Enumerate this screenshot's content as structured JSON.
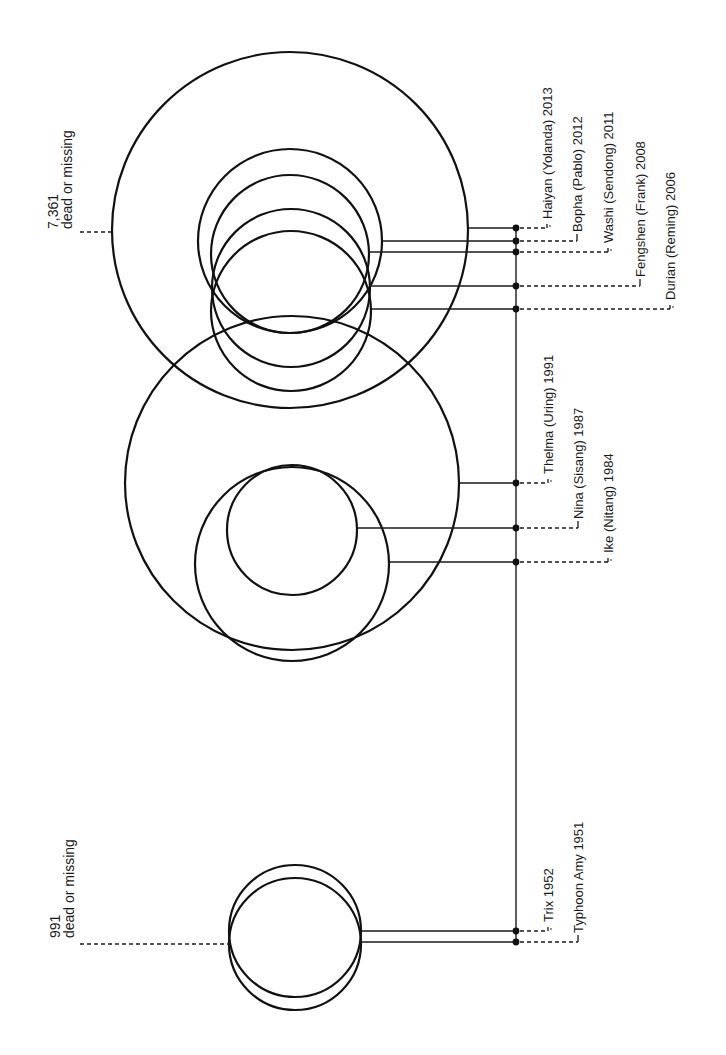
{
  "chart_data": {
    "type": "diagram",
    "title": "",
    "groups": [
      {
        "name": "upper-cluster",
        "total_label": {
          "value": "7,361",
          "caption": "dead or missing",
          "x": 53,
          "y": 229,
          "dash_y": 232,
          "dash_x1": 80,
          "dash_x2": 113
        },
        "storms": [
          {
            "label": "Haiyan (Yolanda) 2013",
            "cx": 290,
            "cy": 230,
            "r": 178,
            "line_y": 228,
            "label_x": 547,
            "tick": "short"
          },
          {
            "label": "Bopha (Pablo) 2012",
            "cx": 290,
            "cy": 241,
            "r": 92,
            "line_y": 241,
            "label_x": 577,
            "tick": "long"
          },
          {
            "label": "Washi (Sendong) 2011",
            "cx": 290,
            "cy": 254,
            "r": 79,
            "line_y": 252,
            "label_x": 608,
            "tick": "short"
          },
          {
            "label": "Fengshen (Frank) 2008",
            "cx": 291,
            "cy": 288,
            "r": 79,
            "line_y": 286,
            "label_x": 640,
            "tick": "long"
          },
          {
            "label": "Durian (Reming) 2006",
            "cx": 291,
            "cy": 311,
            "r": 80,
            "line_y": 309,
            "label_x": 670,
            "tick": "short"
          }
        ]
      },
      {
        "name": "middle-cluster",
        "storms": [
          {
            "label": "Thelma (Uring) 1991",
            "cx": 292,
            "cy": 483,
            "r": 167,
            "line_y": 483,
            "label_x": 548,
            "tick": "short"
          },
          {
            "label": "Nina (Sisang) 1987",
            "cx": 292,
            "cy": 530,
            "r": 65,
            "line_y": 528,
            "label_x": 578,
            "tick": "long"
          },
          {
            "label": "Ike (Nitang) 1984",
            "cx": 292,
            "cy": 564,
            "r": 97,
            "line_y": 562,
            "label_x": 608,
            "tick": "short"
          }
        ]
      },
      {
        "name": "lower-cluster",
        "total_label": {
          "value": "991",
          "caption": "dead or missing",
          "x": 58,
          "y": 938,
          "dash_y": 944,
          "dash_x1": 80,
          "dash_x2": 231
        },
        "storms": [
          {
            "label": "Trix 1952",
            "cx": 295,
            "cy": 931,
            "r": 66,
            "line_y": 931,
            "label_x": 548,
            "tick": "short"
          },
          {
            "label": "Typhoon Amy 1951",
            "cx": 295,
            "cy": 944,
            "r": 66,
            "line_y": 942,
            "label_x": 578,
            "tick": "long"
          }
        ]
      }
    ],
    "spine": {
      "x": 516,
      "y1": 228,
      "y2": 942
    },
    "unit": "dead or missing"
  },
  "annotations": {
    "upper_total": "7,361",
    "upper_caption": "dead or missing",
    "lower_total": "991",
    "lower_caption": "dead or missing"
  },
  "colors": {
    "stroke": "#111111",
    "background": "#ffffff"
  }
}
